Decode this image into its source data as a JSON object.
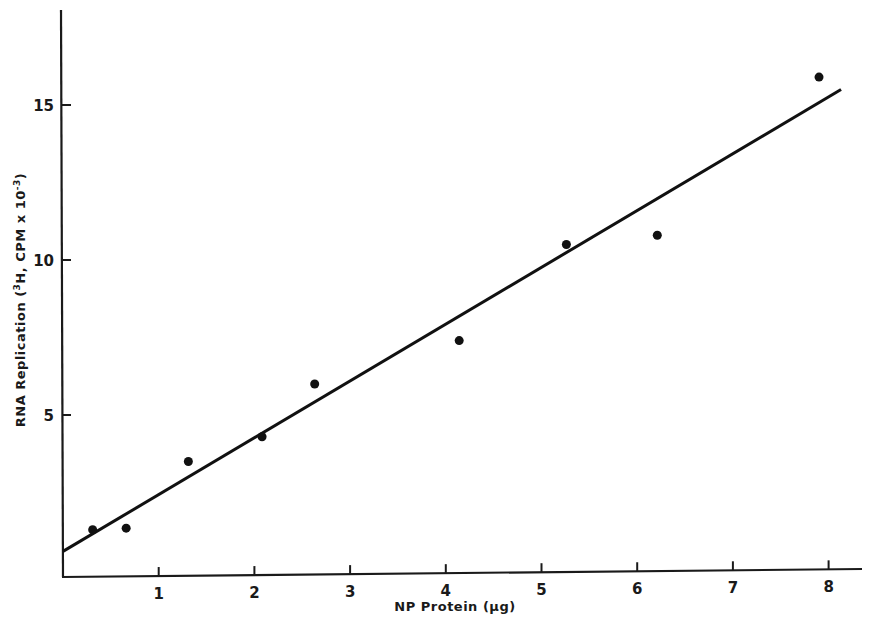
{
  "chart_data": {
    "type": "scatter",
    "title": "",
    "xlabel": "NP Protein (μg)",
    "ylabel": "RNA Replication (³H, CPM x 10⁻³)",
    "xlim": [
      0,
      8.4
    ],
    "ylim": [
      0,
      18
    ],
    "xticks": [
      1,
      2,
      3,
      4,
      5,
      6,
      7,
      8
    ],
    "xtick_labels": [
      "1",
      "2",
      "3",
      "4",
      "5",
      "6",
      "7",
      "8"
    ],
    "yticks": [
      5,
      10,
      15
    ],
    "ytick_labels": [
      "5",
      "10",
      "15"
    ],
    "grid": false,
    "legend": null,
    "series": [
      {
        "name": "data points",
        "type": "scatter",
        "x": [
          0.31,
          0.66,
          1.31,
          2.08,
          2.63,
          4.14,
          5.26,
          6.21,
          7.9
        ],
        "y": [
          1.3,
          1.35,
          3.5,
          4.3,
          6.0,
          7.4,
          10.5,
          10.8,
          15.9
        ]
      },
      {
        "name": "linear fit",
        "type": "line",
        "x": [
          0,
          8.13
        ],
        "y": [
          0.6,
          15.5
        ]
      }
    ]
  },
  "axes": {
    "x_title": "NP Protein (μg)",
    "y_title_main": "RNA Replication (",
    "y_title_sup1": "3",
    "y_title_mid": "H, CPM x 10",
    "y_title_sup2": "-3",
    "y_title_end": ")"
  },
  "colors": {
    "ink": "#111111",
    "background": "#ffffff"
  }
}
